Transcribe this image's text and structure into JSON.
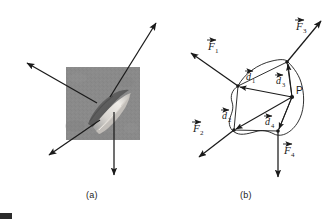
{
  "figure": {
    "stroke_color": "#1a1a1a",
    "panel_a": {
      "caption": "(a)",
      "specimen": {
        "name": "gray-textured-square-specimen",
        "fill_color": "#8a8a8a",
        "x": 66,
        "y": 67,
        "w": 74,
        "h": 73,
        "defect": {
          "name": "crack-blob",
          "highlight_color": "#e8e6e2",
          "shadow_color": "#5a5a5a",
          "angle_deg": -38
        }
      },
      "arrows": [
        {
          "name": "arrow-upper-left",
          "x1": 97,
          "y1": 103,
          "x2": 26,
          "y2": 62
        },
        {
          "name": "arrow-upper-right",
          "x1": 110,
          "y1": 97,
          "x2": 157,
          "y2": 22
        },
        {
          "name": "arrow-lower-left",
          "x1": 100,
          "y1": 120,
          "x2": 48,
          "y2": 156
        },
        {
          "name": "arrow-down",
          "x1": 114,
          "y1": 112,
          "x2": 114,
          "y2": 176
        }
      ]
    },
    "panel_b": {
      "caption": "(b)",
      "point_p": {
        "name": "point-p",
        "label": "P",
        "x": 292,
        "y": 97
      },
      "boundary_vertices": [
        {
          "name": "vertex-1",
          "x": 238,
          "y": 86
        },
        {
          "name": "vertex-2",
          "x": 234,
          "y": 130
        },
        {
          "name": "vertex-3",
          "x": 287,
          "y": 62
        },
        {
          "name": "vertex-4",
          "x": 278,
          "y": 131
        }
      ],
      "distance_vectors": [
        {
          "name": "d1-vector",
          "label": "d⃗1",
          "base": "d",
          "sub": "1",
          "from": [
            292,
            97
          ],
          "to": [
            238,
            86
          ],
          "label_x": 247,
          "label_y": 73
        },
        {
          "name": "d2-vector",
          "label": "d⃗2",
          "base": "d",
          "sub": "2",
          "from": [
            292,
            97
          ],
          "to": [
            234,
            130
          ],
          "label_x": 224,
          "label_y": 112
        },
        {
          "name": "d3-vector",
          "label": "d⃗3",
          "base": "d",
          "sub": "3",
          "from": [
            292,
            97
          ],
          "to": [
            287,
            62
          ],
          "label_x": 288,
          "label_y": 70
        },
        {
          "name": "d4-vector",
          "label": "d⃗4",
          "base": "d",
          "sub": "4",
          "from": [
            292,
            97
          ],
          "to": [
            278,
            131
          ],
          "label_x": 267,
          "label_y": 118
        }
      ],
      "force_vectors": [
        {
          "name": "f1-vector",
          "label": "F⃗1",
          "base": "F",
          "sub": "1",
          "from": [
            238,
            86
          ],
          "to": [
            190,
            52
          ],
          "label_x": 211,
          "label_y": 45
        },
        {
          "name": "f2-vector",
          "label": "F⃗2",
          "base": "F",
          "sub": "2",
          "from": [
            234,
            130
          ],
          "to": [
            198,
            158
          ],
          "label_x": 196,
          "label_y": 127
        },
        {
          "name": "f3-vector",
          "label": "F⃗3",
          "base": "F",
          "sub": "3",
          "from": [
            287,
            62
          ],
          "to": [
            322,
            20
          ],
          "label_x": 299,
          "label_y": 24
        },
        {
          "name": "f4-vector",
          "label": "F⃗4",
          "base": "F",
          "sub": "4",
          "from": [
            278,
            131
          ],
          "to": [
            278,
            178
          ],
          "label_x": 283,
          "label_y": 148
        }
      ]
    }
  }
}
